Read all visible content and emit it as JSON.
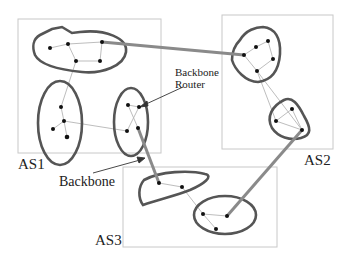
{
  "labels": {
    "as1": "AS1",
    "as2": "AS2",
    "as3": "AS3",
    "backbone": "Backbone",
    "backbone_router_line1": "Backbone",
    "backbone_router_line2": "Router"
  },
  "colors": {
    "box": "#c8c8c8",
    "area_outline": "#555555",
    "backbone_link": "#8a8a8a",
    "internal_link": "#b5b5b5",
    "node": "#111111",
    "arrow": "#333333",
    "text": "#222222"
  },
  "autonomous_systems": [
    {
      "name": "AS1",
      "areas": 3
    },
    {
      "name": "AS2",
      "areas": 2
    },
    {
      "name": "AS3",
      "areas": 2
    }
  ]
}
